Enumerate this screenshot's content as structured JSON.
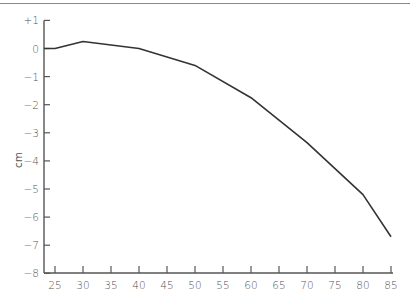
{
  "chart_data": {
    "type": "line",
    "title": "",
    "xlabel": "",
    "ylabel": "cm",
    "xlim": [
      23,
      85
    ],
    "ylim": [
      -8,
      1
    ],
    "grid": false,
    "legend": null,
    "x_ticks": [
      25,
      30,
      35,
      40,
      45,
      50,
      55,
      60,
      65,
      70,
      75,
      80,
      85
    ],
    "y_ticks": [
      {
        "value": 1,
        "label": "+1"
      },
      {
        "value": 0,
        "label": "0"
      },
      {
        "value": -1,
        "label": "−1"
      },
      {
        "value": -2,
        "label": "−2"
      },
      {
        "value": -3,
        "label": "−3"
      },
      {
        "value": -4,
        "label": "−4"
      },
      {
        "value": -5,
        "label": "−5"
      },
      {
        "value": -6,
        "label": "−6"
      },
      {
        "value": -7,
        "label": "−7"
      },
      {
        "value": -8,
        "label": "−8"
      }
    ],
    "series": [
      {
        "name": "series-1",
        "color": "#333333",
        "x": [
          23,
          25,
          30,
          40,
          50,
          60,
          70,
          80,
          85
        ],
        "y": [
          0,
          0,
          0.25,
          0.0,
          -0.6,
          -1.75,
          -3.35,
          -5.2,
          -6.7
        ]
      }
    ]
  },
  "colors": {
    "line": "#333333",
    "axis": "#555555",
    "text": "#555555",
    "top_rule": "#8a8a8a"
  }
}
